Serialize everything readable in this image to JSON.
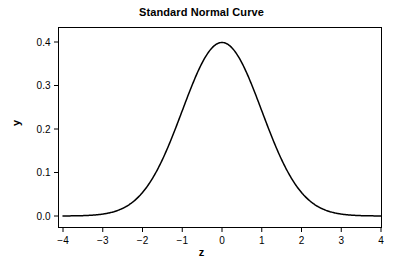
{
  "chart_data": {
    "type": "line",
    "title": "Standard Normal Curve",
    "xlabel": "z",
    "ylabel": "y",
    "xlim": [
      -4,
      4
    ],
    "ylim": [
      0.0,
      0.4
    ],
    "grid": false,
    "legend": "none",
    "xticks": [
      -4,
      -3,
      -2,
      -1,
      0,
      1,
      2,
      3,
      4
    ],
    "xtick_labels": [
      "−4",
      "−3",
      "−2",
      "−1",
      "0",
      "1",
      "2",
      "3",
      "4"
    ],
    "yticks": [
      0.0,
      0.1,
      0.2,
      0.3,
      0.4
    ],
    "ytick_labels": [
      "0.0",
      "0.1",
      "0.2",
      "0.3",
      "0.4"
    ],
    "series": [
      {
        "name": "Standard normal density",
        "color": "#000000",
        "linewidth": 1.5,
        "x": [
          -4.0,
          -3.8,
          -3.6,
          -3.4,
          -3.2,
          -3.0,
          -2.8,
          -2.6,
          -2.4,
          -2.2,
          -2.0,
          -1.8,
          -1.6,
          -1.4,
          -1.2,
          -1.0,
          -0.8,
          -0.6,
          -0.4,
          -0.2,
          0.0,
          0.2,
          0.4,
          0.6,
          0.8,
          1.0,
          1.2,
          1.4,
          1.6,
          1.8,
          2.0,
          2.2,
          2.4,
          2.6,
          2.8,
          3.0,
          3.2,
          3.4,
          3.6,
          3.8,
          4.0
        ],
        "y": [
          0.0001,
          0.0003,
          0.0006,
          0.0012,
          0.0024,
          0.0044,
          0.0079,
          0.0136,
          0.0224,
          0.0355,
          0.054,
          0.079,
          0.1109,
          0.1497,
          0.1942,
          0.242,
          0.2897,
          0.3332,
          0.3683,
          0.391,
          0.3989,
          0.391,
          0.3683,
          0.3332,
          0.2897,
          0.242,
          0.1942,
          0.1497,
          0.1109,
          0.079,
          0.054,
          0.0355,
          0.0224,
          0.0136,
          0.0079,
          0.0044,
          0.0024,
          0.0012,
          0.0006,
          0.0003,
          0.0001
        ]
      }
    ],
    "peak": {
      "x": 0.0,
      "y": 0.3989
    },
    "axis_color": "#000000",
    "background_color": "#ffffff"
  }
}
